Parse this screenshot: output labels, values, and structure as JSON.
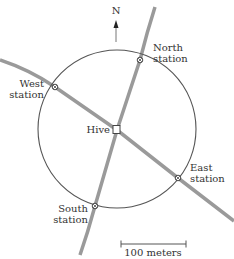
{
  "diagram": {
    "compass": {
      "label": "N"
    },
    "center": {
      "label": "Hive"
    },
    "stations": [
      {
        "id": "north",
        "line1": "North",
        "line2": "station"
      },
      {
        "id": "west",
        "line1": "West",
        "line2": "station"
      },
      {
        "id": "east",
        "line1": "East",
        "line2": "station"
      },
      {
        "id": "south",
        "line1": "South",
        "line2": "station"
      }
    ],
    "scale_bar": {
      "label": "100 meters"
    },
    "colors": {
      "road": "#999999",
      "circle": "#555555",
      "text": "#333333"
    }
  }
}
